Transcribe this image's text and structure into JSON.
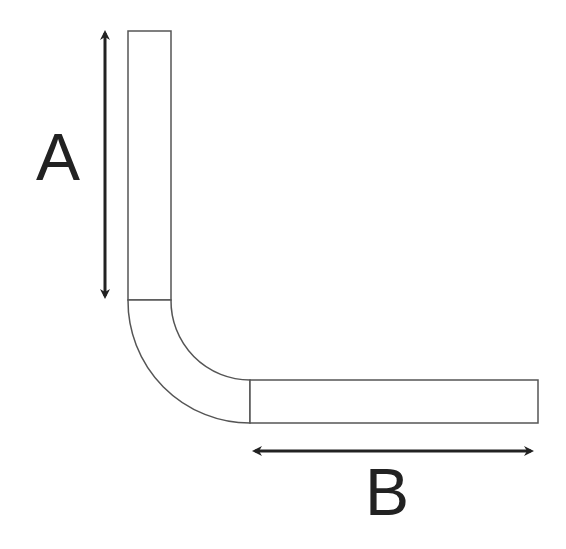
{
  "diagram": {
    "type": "bent-pipe-dimension",
    "labels": {
      "a": "A",
      "b": "B"
    },
    "dimensions": [
      {
        "name": "A",
        "description": "vertical straight length",
        "orientation": "vertical"
      },
      {
        "name": "B",
        "description": "horizontal straight length",
        "orientation": "horizontal"
      }
    ],
    "colors": {
      "outline": "#555555",
      "arrow": "#222222",
      "label": "#222222",
      "background": "#ffffff"
    }
  }
}
